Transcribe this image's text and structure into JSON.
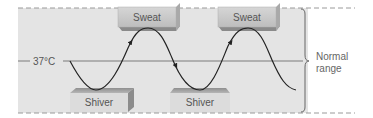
{
  "diagram": {
    "set_point_label": "37°C",
    "range_label_line1": "Normal",
    "range_label_line2": "range",
    "responses": {
      "high": "Sweat",
      "low": "Shiver"
    },
    "blocks": [
      {
        "kind": "sweat",
        "label": "Sweat"
      },
      {
        "kind": "sweat",
        "label": "Sweat"
      },
      {
        "kind": "shiver",
        "label": "Shiver"
      },
      {
        "kind": "shiver",
        "label": "Shiver"
      }
    ],
    "colors": {
      "background": "#e4e4e4",
      "block_face": "#c9c9c9",
      "block_side": "#9a9a9a",
      "curve": "#222222",
      "set_point_line": "#777777",
      "dashed_border": "#999999"
    }
  }
}
